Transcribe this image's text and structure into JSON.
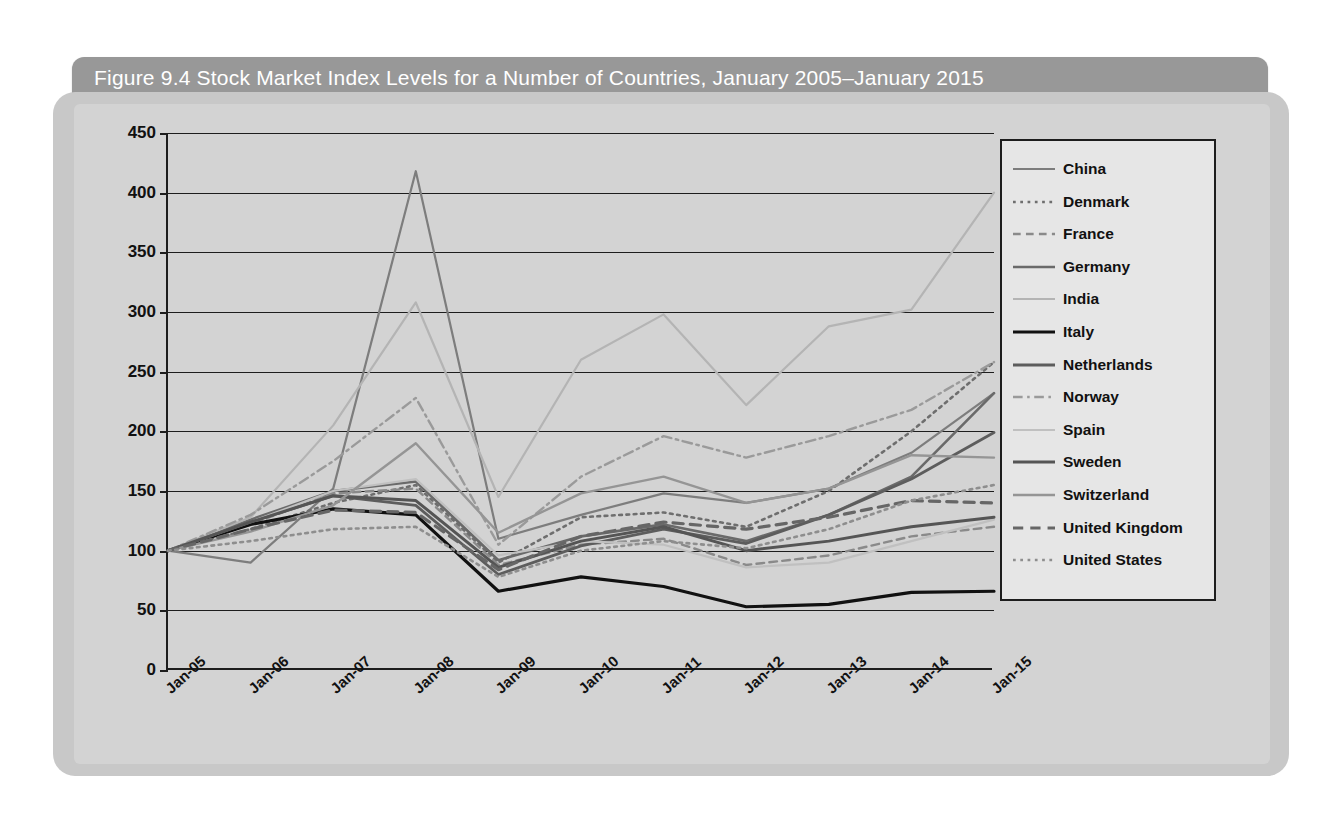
{
  "figure": {
    "title": "Figure 9.4  Stock Market Index Levels for a Number of Countries, January 2005–January 2015"
  },
  "chart_data": {
    "type": "line",
    "title": "Figure 9.4  Stock Market Index Levels for a Number of Countries, January 2005–January 2015",
    "xlabel": "",
    "ylabel": "",
    "categories": [
      "Jan-05",
      "Jan-06",
      "Jan-07",
      "Jan-08",
      "Jan-09",
      "Jan-10",
      "Jan-11",
      "Jan-12",
      "Jan-13",
      "Jan-14",
      "Jan-15"
    ],
    "ylim": [
      0,
      450
    ],
    "ytick_labels": [
      "0",
      "50",
      "100",
      "150",
      "200",
      "250",
      "300",
      "350",
      "400",
      "450"
    ],
    "ytick_values": [
      0,
      50,
      100,
      150,
      200,
      250,
      300,
      350,
      400,
      450
    ],
    "grid": true,
    "legend_position": "right",
    "series": [
      {
        "name": "China",
        "style": "solid",
        "color": "#7d7d7d",
        "width": 2.2,
        "values": [
          100,
          90,
          152,
          418,
          110,
          130,
          148,
          140,
          152,
          182,
          232
        ]
      },
      {
        "name": "Denmark",
        "style": "dotted",
        "color": "#6e6e6e",
        "width": 2.6,
        "values": [
          100,
          118,
          140,
          155,
          90,
          128,
          132,
          120,
          150,
          200,
          258
        ]
      },
      {
        "name": "France",
        "style": "dashed",
        "color": "#8a8a8a",
        "width": 2.4,
        "values": [
          100,
          122,
          148,
          152,
          88,
          105,
          110,
          88,
          96,
          112,
          120
        ]
      },
      {
        "name": "Germany",
        "style": "solid",
        "color": "#6a6a6a",
        "width": 2.6,
        "values": [
          100,
          126,
          150,
          158,
          92,
          112,
          122,
          108,
          130,
          162,
          232
        ]
      },
      {
        "name": "India",
        "style": "solid",
        "color": "#b4b4b4",
        "width": 2.2,
        "values": [
          100,
          128,
          205,
          308,
          145,
          260,
          298,
          222,
          288,
          302,
          400
        ]
      },
      {
        "name": "Italy",
        "style": "solid",
        "color": "#111111",
        "width": 3.2,
        "values": [
          100,
          122,
          135,
          130,
          66,
          78,
          70,
          53,
          55,
          65,
          66
        ]
      },
      {
        "name": "Netherlands",
        "style": "solid",
        "color": "#5d5d5d",
        "width": 2.8,
        "values": [
          100,
          124,
          146,
          138,
          80,
          104,
          118,
          106,
          130,
          160,
          199
        ]
      },
      {
        "name": "Norway",
        "style": "dashdot",
        "color": "#9a9a9a",
        "width": 2.4,
        "values": [
          100,
          130,
          175,
          228,
          105,
          162,
          196,
          178,
          196,
          218,
          258
        ]
      },
      {
        "name": "Spain",
        "style": "solid",
        "color": "#c0c0c0",
        "width": 2.2,
        "values": [
          100,
          124,
          150,
          160,
          96,
          108,
          105,
          86,
          90,
          108,
          126
        ]
      },
      {
        "name": "Sweden",
        "style": "solid",
        "color": "#555555",
        "width": 3.0,
        "values": [
          100,
          124,
          146,
          142,
          86,
          108,
          120,
          100,
          108,
          120,
          128
        ]
      },
      {
        "name": "Switzerland",
        "style": "solid",
        "color": "#959595",
        "width": 2.4,
        "values": [
          100,
          116,
          138,
          190,
          115,
          148,
          162,
          140,
          152,
          180,
          178
        ]
      },
      {
        "name": "United Kingdom",
        "style": "dashed",
        "color": "#666666",
        "width": 3.2,
        "values": [
          100,
          118,
          134,
          132,
          84,
          112,
          124,
          118,
          128,
          142,
          140
        ]
      },
      {
        "name": "United States",
        "style": "dotted",
        "color": "#8e8e8e",
        "width": 2.6,
        "values": [
          100,
          108,
          118,
          120,
          78,
          100,
          108,
          102,
          118,
          142,
          155
        ]
      }
    ]
  }
}
